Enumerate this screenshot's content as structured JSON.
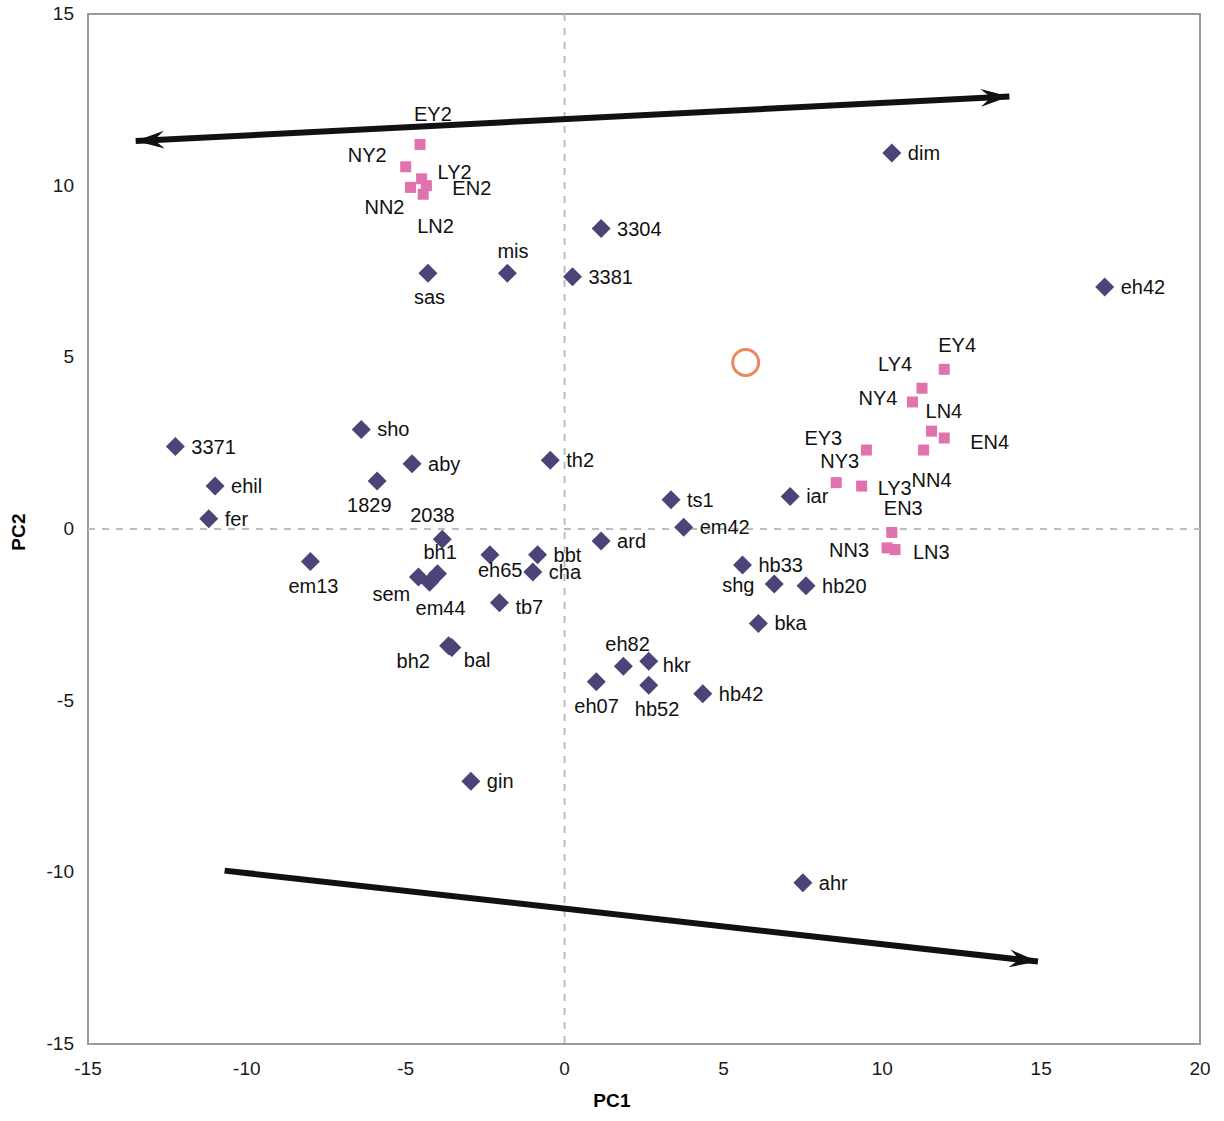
{
  "chart_data": {
    "type": "scatter",
    "title": "",
    "xlabel": "PC1",
    "ylabel": "PC2",
    "xlim": [
      -15,
      20
    ],
    "ylim": [
      -15,
      15
    ],
    "xticks": [
      -15,
      -10,
      -5,
      0,
      5,
      10,
      15,
      20
    ],
    "yticks": [
      -15,
      -10,
      -5,
      0,
      5,
      10,
      15
    ],
    "grid": false,
    "reference_lines": {
      "style": "dashed",
      "color": "#b9b9b9",
      "x": 0,
      "y": 0
    },
    "colors": {
      "diamond_series": "#4a4478",
      "square_series": "#e073ae",
      "annotation_circle": "#f0855e",
      "arrow": "#111111",
      "frame": "#9a9a9a",
      "reference_line": "#bdbdbd"
    },
    "legend": {
      "position": "none",
      "entries": [
        {
          "name": "samples",
          "marker": "diamond",
          "color": "#4a4478"
        },
        {
          "name": "groups",
          "marker": "square",
          "color": "#e073ae"
        }
      ]
    },
    "annotations": [
      {
        "name": "highlight-circle",
        "shape": "circle-outline",
        "x": 5.7,
        "y": 4.85,
        "color": "#f0855e",
        "radius_px": 13
      },
      {
        "name": "pc-axis-arrow-up-right",
        "shape": "double-headed-arrow",
        "from": [
          -13.5,
          11.3
        ],
        "to": [
          14.0,
          12.6
        ],
        "color": "#111111"
      },
      {
        "name": "pc-axis-arrow-down-right",
        "shape": "arrow",
        "from": [
          -10.7,
          -9.95
        ],
        "to": [
          14.9,
          -12.6
        ],
        "color": "#111111"
      }
    ],
    "series": [
      {
        "name": "diamond-points",
        "marker": "diamond",
        "color": "#4a4478",
        "points": [
          {
            "label": "dim",
            "x": 10.3,
            "y": 10.95,
            "lx": 16,
            "ly": -10
          },
          {
            "label": "eh42",
            "x": 17.0,
            "y": 7.05,
            "lx": 16,
            "ly": -10
          },
          {
            "label": "3304",
            "x": 1.15,
            "y": 8.75,
            "lx": 16,
            "ly": -10
          },
          {
            "label": "3381",
            "x": 0.25,
            "y": 7.35,
            "lx": 16,
            "ly": -10
          },
          {
            "label": "mis",
            "x": -1.8,
            "y": 7.45,
            "lx": -10,
            "ly": -32
          },
          {
            "label": "sas",
            "x": -4.3,
            "y": 7.45,
            "lx": -14,
            "ly": 14
          },
          {
            "label": "3371",
            "x": -12.25,
            "y": 2.4,
            "lx": 16,
            "ly": -10
          },
          {
            "label": "sho",
            "x": -6.4,
            "y": 2.9,
            "lx": 16,
            "ly": -10
          },
          {
            "label": "aby",
            "x": -4.8,
            "y": 1.9,
            "lx": 16,
            "ly": -10
          },
          {
            "label": "ehil",
            "x": -11.0,
            "y": 1.25,
            "lx": 16,
            "ly": -10
          },
          {
            "label": "1829",
            "x": -5.9,
            "y": 1.4,
            "lx": -30,
            "ly": 14
          },
          {
            "label": "fer",
            "x": -11.2,
            "y": 0.3,
            "lx": 16,
            "ly": -10
          },
          {
            "label": "th2",
            "x": -0.45,
            "y": 2.0,
            "lx": 16,
            "ly": -10
          },
          {
            "label": "ts1",
            "x": 3.35,
            "y": 0.85,
            "lx": 16,
            "ly": -10
          },
          {
            "label": "em42",
            "x": 3.75,
            "y": 0.05,
            "lx": 16,
            "ly": -10
          },
          {
            "label": "iar",
            "x": 7.1,
            "y": 0.95,
            "lx": 16,
            "ly": -10
          },
          {
            "label": "2038",
            "x": -3.85,
            "y": -0.3,
            "lx": -32,
            "ly": -34
          },
          {
            "label": "ard",
            "x": 1.15,
            "y": -0.35,
            "lx": 16,
            "ly": -10
          },
          {
            "label": "bh1",
            "x": -4.0,
            "y": -1.3,
            "lx": -14,
            "ly": -32
          },
          {
            "label": "eh65",
            "x": -2.35,
            "y": -0.75,
            "lx": -12,
            "ly": 5
          },
          {
            "label": "bbt",
            "x": -0.85,
            "y": -0.75,
            "lx": 16,
            "ly": -10
          },
          {
            "label": "cha",
            "x": -1.0,
            "y": -1.25,
            "lx": 16,
            "ly": -10
          },
          {
            "label": "em13",
            "x": -8.0,
            "y": -0.95,
            "lx": -22,
            "ly": 14
          },
          {
            "label": "sem",
            "x": -4.6,
            "y": -1.4,
            "lx": -46,
            "ly": 7
          },
          {
            "label": "em44",
            "x": -4.25,
            "y": -1.55,
            "lx": -14,
            "ly": 16
          },
          {
            "label": "tb7",
            "x": -2.05,
            "y": -2.15,
            "lx": 16,
            "ly": -6
          },
          {
            "label": "hb33",
            "x": 5.6,
            "y": -1.05,
            "lx": 16,
            "ly": -10
          },
          {
            "label": "shg",
            "x": 6.6,
            "y": -1.6,
            "lx": -52,
            "ly": -9
          },
          {
            "label": "hb20",
            "x": 7.6,
            "y": -1.65,
            "lx": 16,
            "ly": -10
          },
          {
            "label": "bka",
            "x": 6.1,
            "y": -2.75,
            "lx": 16,
            "ly": -10
          },
          {
            "label": "bh2",
            "x": -3.65,
            "y": -3.4,
            "lx": -52,
            "ly": 5
          },
          {
            "label": "bal",
            "x": -3.55,
            "y": -3.45,
            "lx": 12,
            "ly": 3
          },
          {
            "label": "eh82",
            "x": 1.85,
            "y": -4.0,
            "lx": -18,
            "ly": -32
          },
          {
            "label": "hkr",
            "x": 2.65,
            "y": -3.85,
            "lx": 14,
            "ly": -6
          },
          {
            "label": "eh07",
            "x": 1.0,
            "y": -4.45,
            "lx": -22,
            "ly": 14
          },
          {
            "label": "hb52",
            "x": 2.65,
            "y": -4.55,
            "lx": -14,
            "ly": 14
          },
          {
            "label": "hb42",
            "x": 4.35,
            "y": -4.8,
            "lx": 16,
            "ly": -10
          },
          {
            "label": "gin",
            "x": -2.95,
            "y": -7.35,
            "lx": 16,
            "ly": -10
          },
          {
            "label": "ahr",
            "x": 7.5,
            "y": -10.3,
            "lx": 16,
            "ly": -10
          }
        ]
      },
      {
        "name": "square-points",
        "marker": "square",
        "color": "#e073ae",
        "points": [
          {
            "label": "EY2",
            "x": -4.55,
            "y": 11.2,
            "lx": -6,
            "ly": -40
          },
          {
            "label": "NY2",
            "x": -5.0,
            "y": 10.55,
            "lx": -58,
            "ly": -22
          },
          {
            "label": "LY2",
            "x": -4.5,
            "y": 10.2,
            "lx": 16,
            "ly": -17
          },
          {
            "label": "EN2",
            "x": -4.35,
            "y": 10.0,
            "lx": 26,
            "ly": -8
          },
          {
            "label": "NN2",
            "x": -4.85,
            "y": 9.95,
            "lx": -46,
            "ly": 10
          },
          {
            "label": "LN2",
            "x": -4.45,
            "y": 9.75,
            "lx": -6,
            "ly": 22
          },
          {
            "label": "EY4",
            "x": 11.95,
            "y": 4.65,
            "lx": -6,
            "ly": -34
          },
          {
            "label": "LY4",
            "x": 11.25,
            "y": 4.1,
            "lx": -44,
            "ly": -34
          },
          {
            "label": "NY4",
            "x": 10.95,
            "y": 3.7,
            "lx": -54,
            "ly": -14
          },
          {
            "label": "LN4",
            "x": 11.55,
            "y": 2.85,
            "lx": -6,
            "ly": -30
          },
          {
            "label": "EN4",
            "x": 11.95,
            "y": 2.65,
            "lx": 26,
            "ly": -6
          },
          {
            "label": "EY3",
            "x": 9.5,
            "y": 2.3,
            "lx": -62,
            "ly": -22
          },
          {
            "label": "NN4",
            "x": 11.3,
            "y": 2.3,
            "lx": -12,
            "ly": 20
          },
          {
            "label": "NY3",
            "x": 8.55,
            "y": 1.35,
            "lx": -16,
            "ly": -32
          },
          {
            "label": "LY3",
            "x": 9.35,
            "y": 1.25,
            "lx": 16,
            "ly": -8
          },
          {
            "label": "EN3",
            "x": 10.3,
            "y": -0.1,
            "lx": -8,
            "ly": -34
          },
          {
            "label": "NN3",
            "x": 10.15,
            "y": -0.55,
            "lx": -58,
            "ly": -8
          },
          {
            "label": "LN3",
            "x": 10.4,
            "y": -0.6,
            "lx": 18,
            "ly": -8
          }
        ]
      }
    ]
  }
}
